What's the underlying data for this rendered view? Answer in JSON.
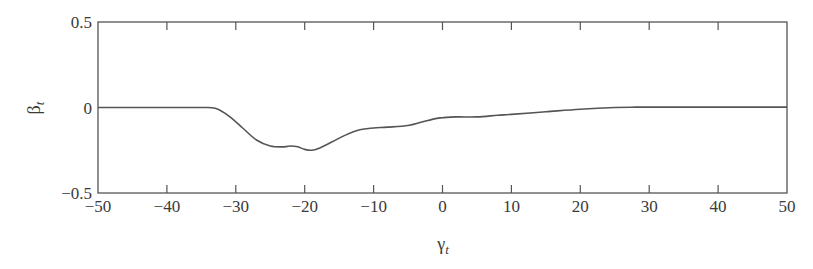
{
  "chart_data": {
    "type": "line",
    "title": "",
    "xlabel": "γ_t",
    "ylabel": "β_t",
    "xlim": [
      -50,
      50
    ],
    "ylim": [
      -0.5,
      0.5
    ],
    "grid": false,
    "legend": null,
    "x_ticks": [
      -50,
      -40,
      -30,
      -20,
      -10,
      0,
      10,
      20,
      30,
      40,
      50
    ],
    "x_tick_labels": [
      "−50",
      "−40",
      "−30",
      "−20",
      "−10",
      "0",
      "10",
      "20",
      "30",
      "40",
      "50"
    ],
    "y_ticks": [
      -0.5,
      0,
      0.5
    ],
    "y_tick_labels": [
      "−0.5",
      "0",
      "0.5"
    ],
    "series": [
      {
        "name": "β_t",
        "color": "#555555",
        "x": [
          -50,
          -40,
          -35,
          -33,
          -31,
          -29,
          -27,
          -25,
          -23,
          -22,
          -21,
          -20,
          -19,
          -18,
          -16,
          -14,
          -12,
          -10,
          -8,
          -5,
          -3,
          -1,
          0,
          2,
          5,
          8,
          10,
          15,
          20,
          25,
          28,
          30,
          35,
          40,
          45,
          50
        ],
        "values": [
          0,
          0,
          0,
          -0.005,
          -0.05,
          -0.12,
          -0.19,
          -0.225,
          -0.23,
          -0.225,
          -0.23,
          -0.245,
          -0.25,
          -0.24,
          -0.2,
          -0.16,
          -0.13,
          -0.12,
          -0.115,
          -0.105,
          -0.085,
          -0.065,
          -0.06,
          -0.055,
          -0.055,
          -0.045,
          -0.04,
          -0.025,
          -0.01,
          0,
          0.002,
          0.002,
          0.002,
          0.002,
          0.002,
          0.002
        ]
      }
    ]
  },
  "axes": {
    "x_label_main": "γ",
    "x_label_sub": "t",
    "y_label_main": "β",
    "y_label_sub": "t"
  }
}
